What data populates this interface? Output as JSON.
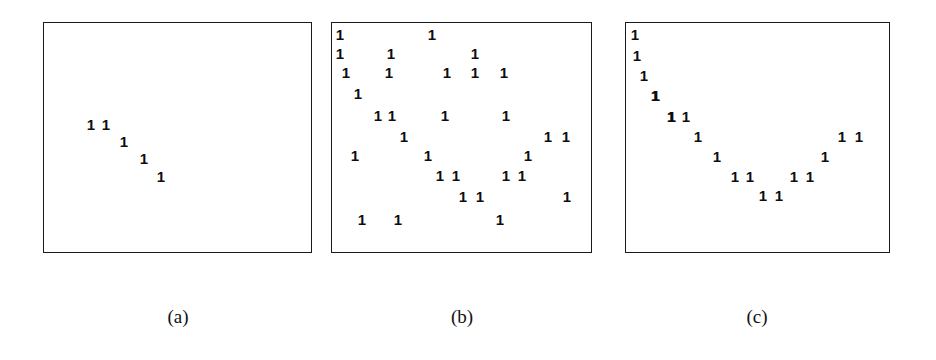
{
  "figure": {
    "background_color": "#ffffff",
    "mark_color": "#0d0d0d",
    "frame_color": "#1a1a1a",
    "mark_glyph": "1"
  },
  "panels": [
    {
      "id": "panel-a",
      "caption": "(a)",
      "caption_x": 178,
      "frame": {
        "x": 43,
        "y": 22,
        "width": 269,
        "height": 231
      }
    },
    {
      "id": "panel-b",
      "caption": "(b)",
      "caption_x": 462,
      "frame": {
        "x": 331,
        "y": 22,
        "width": 261,
        "height": 231
      }
    },
    {
      "id": "panel-c",
      "caption": "(c)",
      "caption_x": 757,
      "frame": {
        "x": 625,
        "y": 22,
        "width": 265,
        "height": 231
      }
    }
  ],
  "caption_y": 306,
  "chart_data": [
    {
      "type": "scatter",
      "title": "(a)",
      "xlabel": "",
      "ylabel": "",
      "xlim": [
        0,
        269
      ],
      "ylim": [
        0,
        231
      ],
      "grid": false,
      "legend": "none",
      "marker_label": "1",
      "n_points": 5,
      "description": "sparse short descending diagonal cluster near upper-left-of-centre",
      "points": [
        {
          "x": 47,
          "y": 101
        },
        {
          "x": 62,
          "y": 101
        },
        {
          "x": 80,
          "y": 118
        },
        {
          "x": 100,
          "y": 135
        },
        {
          "x": 117,
          "y": 153
        }
      ]
    },
    {
      "type": "scatter",
      "title": "(b)",
      "xlabel": "",
      "ylabel": "",
      "xlim": [
        0,
        261
      ],
      "ylim": [
        0,
        231
      ],
      "grid": false,
      "legend": "none",
      "marker_label": "1",
      "n_points": 31,
      "description": "broadly scattered points filling the panel with no clear trend",
      "points": [
        {
          "x": 8,
          "y": 11
        },
        {
          "x": 100,
          "y": 11
        },
        {
          "x": 8,
          "y": 30
        },
        {
          "x": 59,
          "y": 30
        },
        {
          "x": 143,
          "y": 30
        },
        {
          "x": 14,
          "y": 49
        },
        {
          "x": 57,
          "y": 49
        },
        {
          "x": 115,
          "y": 49
        },
        {
          "x": 143,
          "y": 49
        },
        {
          "x": 172,
          "y": 49
        },
        {
          "x": 26,
          "y": 70
        },
        {
          "x": 46,
          "y": 92
        },
        {
          "x": 60,
          "y": 92
        },
        {
          "x": 113,
          "y": 92
        },
        {
          "x": 174,
          "y": 92
        },
        {
          "x": 72,
          "y": 113
        },
        {
          "x": 216,
          "y": 113
        },
        {
          "x": 234,
          "y": 113
        },
        {
          "x": 23,
          "y": 132
        },
        {
          "x": 96,
          "y": 132
        },
        {
          "x": 196,
          "y": 132
        },
        {
          "x": 108,
          "y": 152
        },
        {
          "x": 124,
          "y": 152
        },
        {
          "x": 174,
          "y": 152
        },
        {
          "x": 190,
          "y": 152
        },
        {
          "x": 131,
          "y": 173
        },
        {
          "x": 148,
          "y": 173
        },
        {
          "x": 235,
          "y": 173
        },
        {
          "x": 30,
          "y": 196
        },
        {
          "x": 66,
          "y": 196
        },
        {
          "x": 168,
          "y": 196
        }
      ]
    },
    {
      "type": "scatter",
      "title": "(c)",
      "xlabel": "",
      "ylabel": "",
      "xlim": [
        0,
        265
      ],
      "ylim": [
        0,
        231
      ],
      "grid": false,
      "legend": "none",
      "marker_label": "1",
      "n_points": 19,
      "description": "U-shaped / V-shaped curvilinear band descending from upper-left to a minimum then rising to the right",
      "points": [
        {
          "x": 9,
          "y": 11
        },
        {
          "x": 11,
          "y": 32
        },
        {
          "x": 18,
          "y": 52
        },
        {
          "x": 30,
          "y": 72
        },
        {
          "x": 45,
          "y": 93
        },
        {
          "x": 60,
          "y": 93
        },
        {
          "x": 72,
          "y": 113
        },
        {
          "x": 91,
          "y": 133
        },
        {
          "x": 109,
          "y": 153
        },
        {
          "x": 124,
          "y": 153
        },
        {
          "x": 137,
          "y": 172
        },
        {
          "x": 153,
          "y": 172
        },
        {
          "x": 168,
          "y": 153
        },
        {
          "x": 184,
          "y": 153
        },
        {
          "x": 199,
          "y": 133
        },
        {
          "x": 216,
          "y": 113
        },
        {
          "x": 233,
          "y": 113
        },
        {
          "x": 29,
          "y": 72
        },
        {
          "x": 46,
          "y": 93
        }
      ]
    }
  ]
}
